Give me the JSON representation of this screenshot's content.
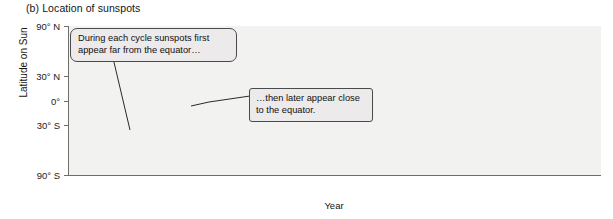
{
  "figure": {
    "panel_label": "(b)",
    "title": "(b)  Location of sunspots"
  },
  "annotations": {
    "high_latitude": "During each cycle sunspots first appear far from the equator…",
    "low_latitude": "…then later appear close to the equator."
  },
  "axes": {
    "y_title": "Latitude on Sun",
    "x_title": "Year",
    "y_ticks": [
      "90° N",
      "30° N",
      "0°",
      "30° S",
      "90° S"
    ],
    "x_ticks": [
      "1975",
      "1980",
      "1985",
      "1990",
      "1995",
      "2000",
      "2005",
      "2010"
    ]
  },
  "colors": {
    "plot_background": "#f2f2f0",
    "axis_line": "#6e6e6e",
    "marker": "#101010",
    "callout_fill": "#eceaea",
    "callout_border": "#4a4a4a",
    "page_background": "#ffffff"
  },
  "chart_data": {
    "type": "scatter",
    "title": "(b)  Location of sunspots",
    "subtitle": "",
    "xlabel": "Year",
    "ylabel": "Latitude on Sun",
    "xlim": [
      1974.3,
      2012.3
    ],
    "ylim": [
      -90,
      90
    ],
    "grid": true,
    "grid_axis": "x",
    "legend": "none",
    "x_tick_values": [
      1975,
      1980,
      1985,
      1990,
      1995,
      2000,
      2005,
      2010
    ],
    "y_tick_values": [
      90,
      30,
      0,
      -30,
      -90
    ],
    "y_tick_labels": [
      "90° N",
      "30° N",
      "0°",
      "30° S",
      "90° S"
    ],
    "annotations": [
      {
        "text": "During each cycle sunspots first appear far from the equator…",
        "points_to_x": 1977.4,
        "points_to_y": -22
      },
      {
        "text": "…then later appear close to the equator.",
        "points_to_x": 1987.4,
        "points_to_y": 4
      }
    ],
    "cycles": [
      {
        "name": "Cycle 21",
        "start": 1976.5,
        "max": 1979.9,
        "end": 1986.5,
        "start_latitude": 31,
        "end_latitude": 6,
        "peak_density": 1.0
      },
      {
        "name": "Cycle 22",
        "start": 1986.5,
        "max": 1989.9,
        "end": 1996.4,
        "start_latitude": 30,
        "end_latitude": 6,
        "peak_density": 1.0
      },
      {
        "name": "Cycle 23",
        "start": 1996.4,
        "max": 2001.0,
        "end": 2008.8,
        "start_latitude": 30,
        "end_latitude": 6,
        "peak_density": 0.95
      },
      {
        "name": "Cycle 24",
        "start": 2009.6,
        "max": 2013.0,
        "end": 2012.3,
        "start_latitude": 28,
        "end_latitude": 16,
        "peak_density": 0.45
      }
    ],
    "partial_cycle_before_1975": {
      "name": "Cycle 20 tail",
      "start": 1974.3,
      "end": 1976.6,
      "start_latitude": 14,
      "end_latitude": 6,
      "peak_density": 0.3
    },
    "series": [
      {
        "name": "Sunspot group latitudes (northern hemisphere)",
        "hemisphere": "north",
        "latitude_range": [
          2,
          38
        ]
      },
      {
        "name": "Sunspot group latitudes (southern hemisphere)",
        "hemisphere": "south",
        "latitude_range": [
          -38,
          -2
        ]
      }
    ]
  }
}
